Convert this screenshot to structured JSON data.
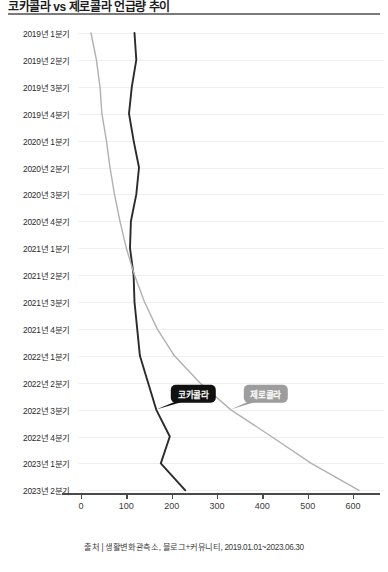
{
  "header": {
    "title": "코카콜라 vs 제로콜라 언급량 추이",
    "source_note": "출처 | 생활변화관측소, 블로그+커뮤니티, 2019.01.01~2023.06.30"
  },
  "colors": {
    "coke_line": "#2b2b2b",
    "zero_line": "#b0b0b0",
    "axis": "#4a4a4a",
    "grid": "#f0eeee",
    "callout_dark": "#111111",
    "callout_gray": "#9d9d9d"
  },
  "labels": {
    "coke": "코카콜라",
    "zero": "제로콜라"
  },
  "chart_data": {
    "type": "line",
    "title": "코카콜라 vs 제로콜라 언급량 추이",
    "orientation": "horizontal-value-vertical-category",
    "xlabel": "",
    "ylabel": "",
    "xlim": [
      0,
      650
    ],
    "ylim": null,
    "grid": true,
    "legend": "inline-callout",
    "xticks": [
      0,
      100,
      200,
      300,
      400,
      500,
      600
    ],
    "categories": [
      "2019년 1분기",
      "2019년 2분기",
      "2019년 3분기",
      "2019년 4분기",
      "2020년 1분기",
      "2020년 2분기",
      "2020년 3분기",
      "2020년 4분기",
      "2021년 1분기",
      "2021년 2분기",
      "2021년 3분기",
      "2021년 4분기",
      "2022년 1분기",
      "2022년 2분기",
      "2022년 3분기",
      "2022년 4분기",
      "2023년 1분기",
      "2023년 2분기"
    ],
    "series": [
      {
        "name": "코카콜라",
        "color": "#2b2b2b",
        "values": [
          118,
          122,
          112,
          106,
          116,
          128,
          122,
          110,
          108,
          116,
          118,
          124,
          130,
          148,
          166,
          196,
          176,
          230
        ]
      },
      {
        "name": "제로콜라",
        "color": "#b0b0b0",
        "values": [
          22,
          34,
          42,
          46,
          56,
          64,
          74,
          86,
          100,
          118,
          140,
          168,
          206,
          262,
          330,
          420,
          508,
          613
        ]
      }
    ],
    "annotations": [
      {
        "label": "코카콜라",
        "category": "2022년 3분기",
        "value": 166,
        "style": "dark"
      },
      {
        "label": "제로콜라",
        "category": "2022년 3분기",
        "value": 330,
        "style": "gray"
      }
    ]
  }
}
